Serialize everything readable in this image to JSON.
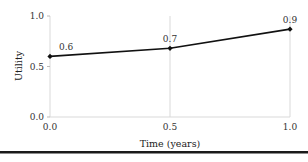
{
  "chart_data": {
    "type": "line",
    "title": "",
    "xlabel": "Time (years)",
    "ylabel": "Utility",
    "xlim": [
      0.0,
      1.0
    ],
    "ylim": [
      0.0,
      1.0
    ],
    "x_ticks": [
      "0.0",
      "0.5",
      "1.0"
    ],
    "y_ticks": [
      "0.0",
      "0.5",
      "1.0"
    ],
    "grid": "vertical lines at x ticks",
    "series": [
      {
        "name": "Utility",
        "x": [
          0.0,
          0.5,
          1.0
        ],
        "values": [
          0.6,
          0.68,
          0.87
        ],
        "labels": [
          "0.6",
          "0.7",
          "0.9"
        ]
      }
    ],
    "colors": {
      "line": "#111111",
      "grid": "#d9d9d9",
      "rule": "#1a1a1a"
    }
  }
}
